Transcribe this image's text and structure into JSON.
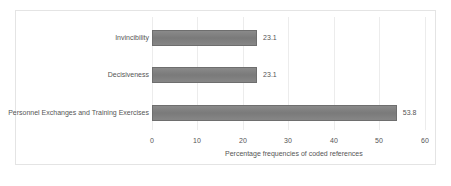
{
  "chart_data": {
    "type": "bar",
    "orientation": "horizontal",
    "title": "",
    "categories": [
      "Invincibility",
      "Decisiveness",
      "Personnel Exchanges and Training Exercises"
    ],
    "values": [
      23.1,
      23.1,
      53.8
    ],
    "value_labels": [
      "23.1",
      "23.1",
      "53.8"
    ],
    "xlabel": "Percentage frequencies of coded references",
    "ylabel": "",
    "xlim": [
      0,
      60
    ],
    "xticks": [
      "0",
      "10",
      "20",
      "30",
      "40",
      "50",
      "60"
    ],
    "grid": true,
    "legend": null,
    "bar_color": "#808080"
  }
}
